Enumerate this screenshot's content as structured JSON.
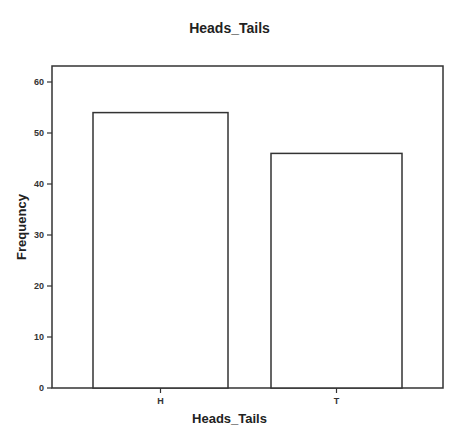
{
  "chart_data": {
    "type": "bar",
    "title": "Heads_Tails",
    "xlabel": "Heads_Tails",
    "ylabel": "Frequency",
    "categories": [
      "H",
      "T"
    ],
    "values": [
      54,
      46
    ],
    "ylim": [
      0,
      63
    ],
    "yticks": [
      0,
      10,
      20,
      30,
      40,
      50,
      60
    ],
    "grid": false,
    "legend": null,
    "bar_fill": "#ffffff",
    "bar_stroke": "#333333"
  }
}
